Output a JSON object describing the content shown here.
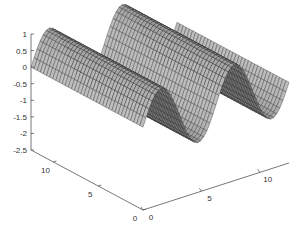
{
  "chart_data": {
    "type": "surface",
    "title": "",
    "xlabel": "",
    "ylabel": "",
    "zlabel": "",
    "function": "z = sin(x)",
    "x_range": [
      0,
      12.5
    ],
    "y_range": [
      0,
      12.5
    ],
    "zlim": [
      -2.5,
      1
    ],
    "z_ticks": [
      1,
      0.5,
      0,
      -0.5,
      -1,
      -1.5,
      -2,
      -2.5
    ],
    "z_tick_labels": [
      "1",
      "0.5",
      "0",
      "-0.5",
      "-1",
      "-1.5",
      "-2",
      "-2.5"
    ],
    "x_ticks": [
      0,
      5,
      10
    ],
    "x_tick_labels": [
      "0",
      "5",
      "10"
    ],
    "y_ticks": [
      0,
      5,
      10
    ],
    "y_tick_labels": [
      "0",
      "5",
      "10"
    ],
    "colormap": "gray",
    "edge_color": "#222222",
    "face_color": "#a8a8a8",
    "grid": false,
    "legend": null
  }
}
